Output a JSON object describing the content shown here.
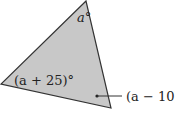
{
  "diagram": {
    "type": "triangle",
    "fill_color": "#c8c8c8",
    "stroke_color": "#333333",
    "vertices": {
      "top": [
        86,
        1
      ],
      "left": [
        1,
        84
      ],
      "bottom_right": [
        111,
        108
      ]
    },
    "angle_labels": {
      "top": "a°",
      "left": "(a + 25)°",
      "bottom_right": "(a − 10)°"
    }
  }
}
